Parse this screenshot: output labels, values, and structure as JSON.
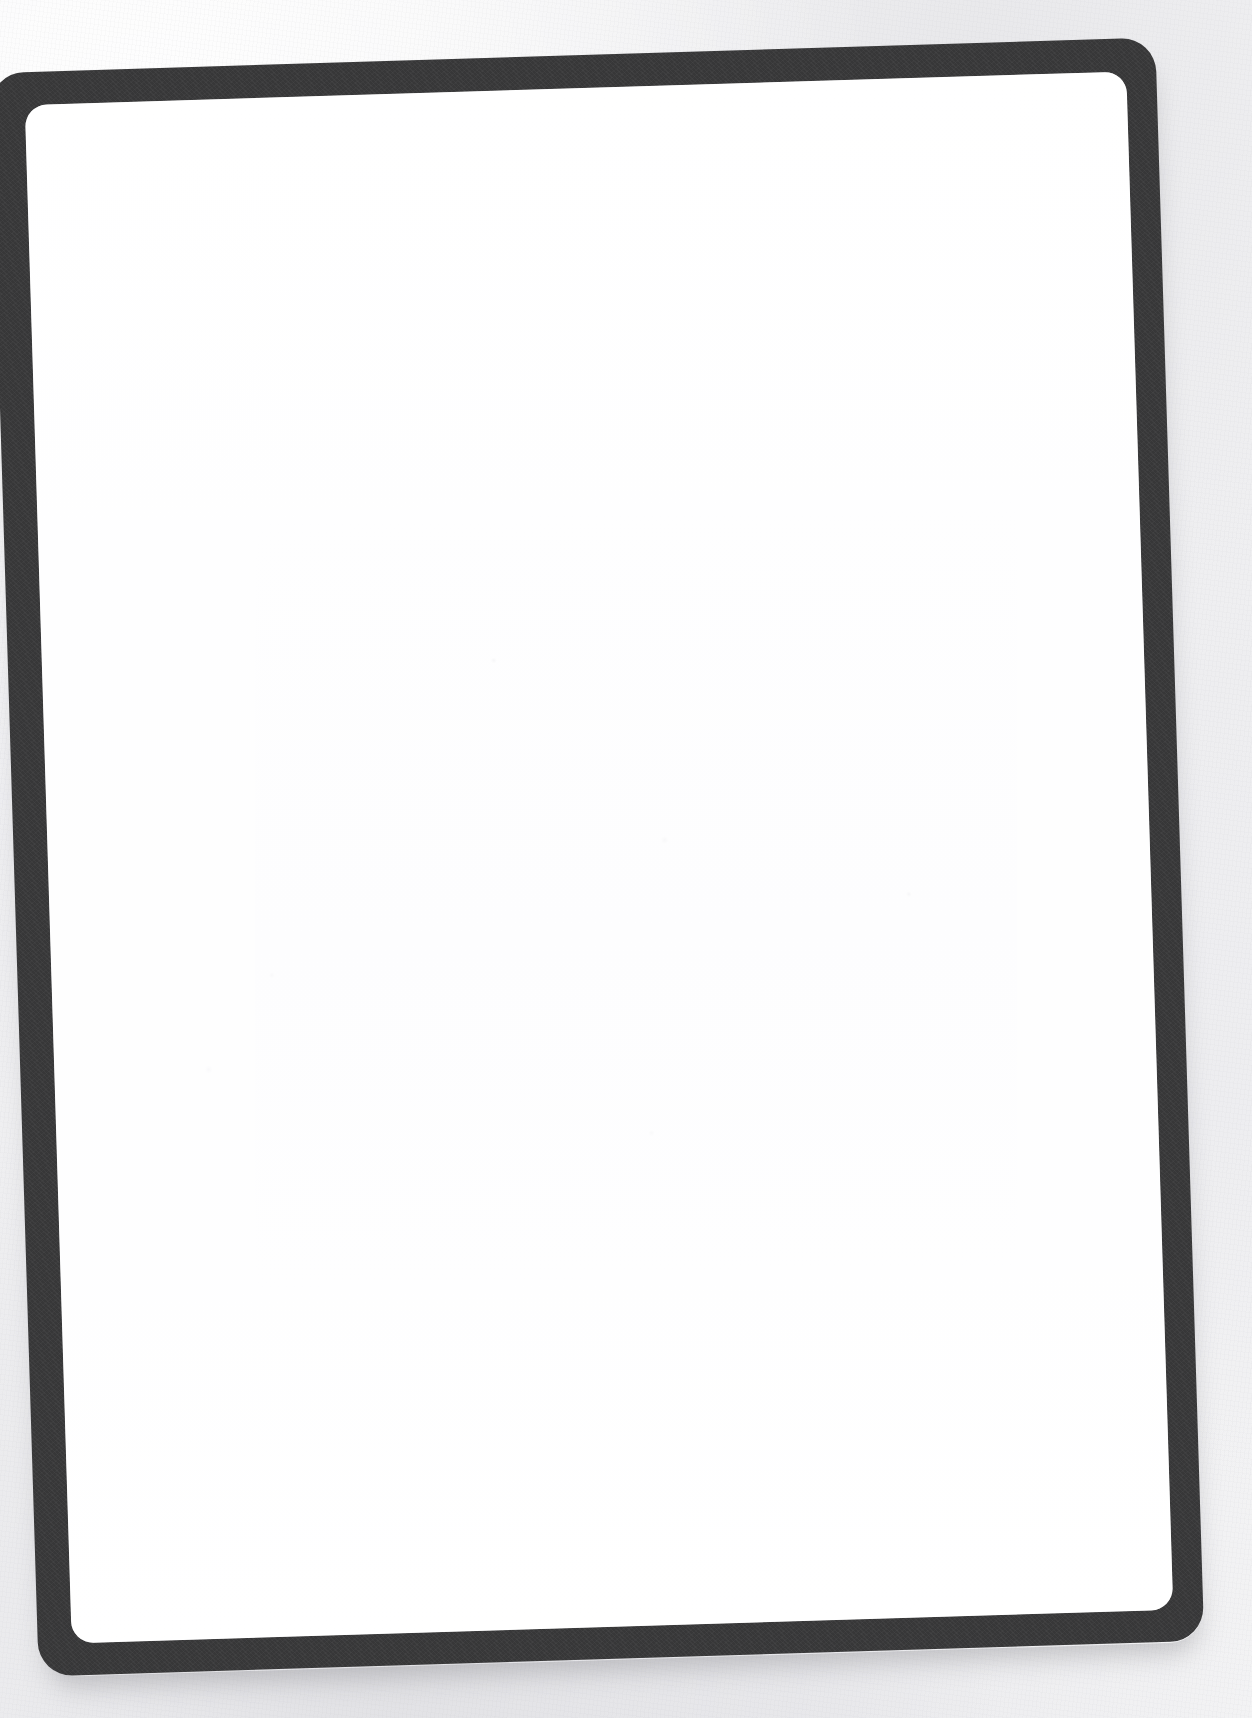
{
  "document": {
    "type": "scanned-image",
    "subject": "blank bordered card",
    "page_content": "",
    "content_text": ""
  },
  "canvas": {
    "width": 1252,
    "height": 1718
  },
  "colors": {
    "paper_background": "#f2f2f3",
    "frame_border": "#3a3a3b",
    "content_background": "#ffffff",
    "shadow": "#78787e"
  },
  "card": {
    "rotation_degrees": -1.75,
    "left": 14,
    "top": 55,
    "width": 1166,
    "height": 1604,
    "outer_corner_radius": 34,
    "inner_corner_radius": 22,
    "border_thickness": 33
  }
}
